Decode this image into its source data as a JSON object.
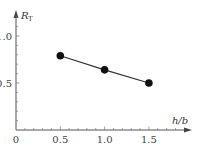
{
  "chart_data": {
    "type": "line",
    "title": "",
    "xlabel": "h/b",
    "ylabel": "R",
    "ylabel_subscript": "T",
    "x": [
      0.5,
      1.0,
      1.5
    ],
    "series": [
      {
        "name": "R_T",
        "values": [
          0.79,
          0.64,
          0.5
        ]
      }
    ],
    "xlim": [
      0,
      1.9
    ],
    "ylim": [
      0,
      1.25
    ],
    "xticks": [
      "0",
      "0.5",
      "1.0",
      "1.5"
    ],
    "yticks": [
      "0.5",
      "1.0"
    ],
    "grid": false,
    "legend": null,
    "marker": "filled-circle",
    "line_color": "#333333",
    "marker_color": "#111111"
  }
}
